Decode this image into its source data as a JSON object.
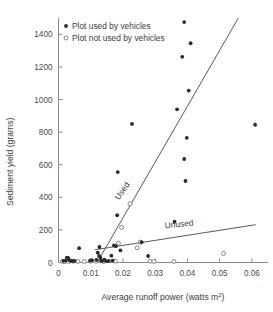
{
  "chart_data": {
    "type": "scatter",
    "title": "",
    "xlabel": "Average runoff power (watts m²)",
    "xlabel_main": "Average runoff power (watts m",
    "xlabel_sup": "2",
    "xlabel_tail": ")",
    "ylabel": "Sediment yield (grams)",
    "xlim": [
      0,
      0.065
    ],
    "ylim": [
      0,
      1500
    ],
    "xticks": [
      0,
      0.01,
      0.02,
      0.03,
      0.04,
      0.05,
      0.06
    ],
    "xticklabels": [
      "0",
      "0.01",
      "0.02",
      "0.03",
      "0.04",
      "0.05",
      "0.06"
    ],
    "yticks": [
      0,
      200,
      400,
      600,
      800,
      1000,
      1200,
      1400
    ],
    "yticklabels": [
      "0",
      "200",
      "400",
      "600",
      "800",
      "1000",
      "1200",
      "1400"
    ],
    "grid": false,
    "legend_position": "top-left-inside",
    "marker_colors": {
      "used_fill": "#2b2b2b",
      "unused_fill": "#ffffff",
      "unused_stroke": "#7a7a7a",
      "line": "#5a5a5a",
      "axis": "#8a8a8a",
      "text": "#3c3c3c"
    },
    "legend": [
      {
        "key": "used",
        "label": "Plot used by vehicles",
        "marker": "filled-circle"
      },
      {
        "key": "unused",
        "label": "Plot not used by vehicles",
        "marker": "open-circle"
      }
    ],
    "annotations": [
      {
        "key": "used-line-label",
        "text": "Used",
        "x": 0.0205,
        "y": 430,
        "rotation": -56
      },
      {
        "key": "unused-line-label",
        "text": "Unused",
        "x": 0.0375,
        "y": 218,
        "rotation": -6
      }
    ],
    "series": [
      {
        "name": "Plot used by vehicles",
        "marker": "filled-circle",
        "points": [
          [
            0.0015,
            10
          ],
          [
            0.0022,
            12
          ],
          [
            0.0026,
            30
          ],
          [
            0.003,
            28
          ],
          [
            0.0034,
            14
          ],
          [
            0.0038,
            10
          ],
          [
            0.0043,
            8
          ],
          [
            0.005,
            10
          ],
          [
            0.0064,
            88
          ],
          [
            0.0098,
            12
          ],
          [
            0.0104,
            14
          ],
          [
            0.0118,
            16
          ],
          [
            0.0122,
            60
          ],
          [
            0.0126,
            40
          ],
          [
            0.0127,
            95
          ],
          [
            0.013,
            30
          ],
          [
            0.0132,
            12
          ],
          [
            0.0136,
            10
          ],
          [
            0.0142,
            18
          ],
          [
            0.0148,
            8
          ],
          [
            0.0156,
            10
          ],
          [
            0.0164,
            42
          ],
          [
            0.0168,
            12
          ],
          [
            0.0172,
            105
          ],
          [
            0.0178,
            100
          ],
          [
            0.0182,
            290
          ],
          [
            0.0184,
            555
          ],
          [
            0.0192,
            75
          ],
          [
            0.0228,
            850
          ],
          [
            0.0258,
            125
          ],
          [
            0.0278,
            40
          ],
          [
            0.036,
            250
          ],
          [
            0.0368,
            940
          ],
          [
            0.0384,
            1262
          ],
          [
            0.039,
            635
          ],
          [
            0.0394,
            500
          ],
          [
            0.0398,
            765
          ],
          [
            0.0404,
            1055
          ],
          [
            0.041,
            1345
          ],
          [
            0.039,
            1475
          ],
          [
            0.061,
            845
          ]
        ]
      },
      {
        "name": "Plot not used by vehicles",
        "marker": "open-circle",
        "points": [
          [
            0.0012,
            6
          ],
          [
            0.002,
            6
          ],
          [
            0.0032,
            6
          ],
          [
            0.0046,
            8
          ],
          [
            0.006,
            6
          ],
          [
            0.008,
            6
          ],
          [
            0.01,
            8
          ],
          [
            0.0116,
            8
          ],
          [
            0.014,
            6
          ],
          [
            0.0176,
            8
          ],
          [
            0.0186,
            118
          ],
          [
            0.0196,
            215
          ],
          [
            0.0222,
            360
          ],
          [
            0.0244,
            90
          ],
          [
            0.0254,
            125
          ],
          [
            0.0284,
            8
          ],
          [
            0.0296,
            6
          ],
          [
            0.0358,
            6
          ],
          [
            0.0512,
            55
          ]
        ]
      }
    ],
    "fit_lines": [
      {
        "name": "Used",
        "x1": 0.012,
        "y1": 0,
        "x2": 0.0558,
        "y2": 1500
      },
      {
        "name": "Unused",
        "x1": 0.0112,
        "y1": 78,
        "x2": 0.0612,
        "y2": 232
      }
    ]
  }
}
